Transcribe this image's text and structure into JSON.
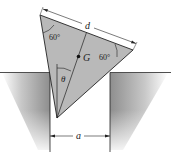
{
  "figure": {
    "labels": {
      "d": "d",
      "a": "a",
      "G": "G",
      "theta": "θ",
      "angle_top_left": "60°",
      "angle_right": "60°"
    },
    "colors": {
      "triangle_fill": "#b9b9b9",
      "ground_shade": "#9a9a9a",
      "line": "#222222",
      "background": "#ffffff"
    }
  }
}
